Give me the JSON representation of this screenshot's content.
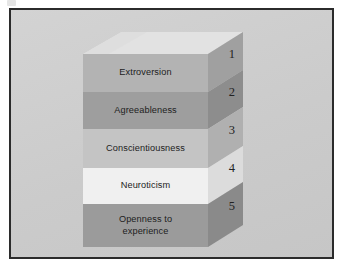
{
  "figure": {
    "type": "stacked-3d-block-diagram",
    "title": "",
    "background_color": "#cecece",
    "frame_color": "#2b2b2b",
    "top_face_color": "#e2e2e2"
  },
  "layers": [
    {
      "number": "1",
      "label": "Extroversion",
      "front_color": "#b3b3b3",
      "side_color": "#a0a0a0"
    },
    {
      "number": "2",
      "label": "Agreeableness",
      "front_color": "#9e9e9e",
      "side_color": "#8d8d8d"
    },
    {
      "number": "3",
      "label": "Conscientiousness",
      "front_color": "#c4c4c4",
      "side_color": "#b0b0b0"
    },
    {
      "number": "4",
      "label": "Neuroticism",
      "front_color": "#f0f0f0",
      "side_color": "#dcdcdc"
    },
    {
      "number": "5",
      "label": "Openness to\nexperience",
      "front_color": "#9b9b9b",
      "side_color": "#8a8a8a"
    }
  ]
}
